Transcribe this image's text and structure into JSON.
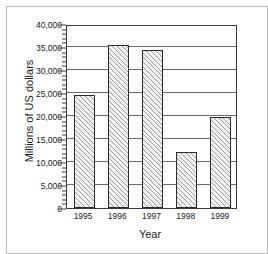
{
  "chart_data": {
    "type": "bar",
    "title": "",
    "xlabel": "Year",
    "ylabel": "Millions of US dollars",
    "categories": [
      "1995",
      "1996",
      "1997",
      "1998",
      "1999"
    ],
    "values": [
      24500,
      35400,
      34300,
      12200,
      19800
    ],
    "series": [
      {
        "name": "Millions of US dollars",
        "values": [
          24500,
          35400,
          34300,
          12200,
          19800
        ]
      }
    ],
    "ylim": [
      0,
      40000
    ],
    "ytick_labels": [
      "0",
      "5,000",
      "10,000",
      "15,000",
      "20,000",
      "25,000",
      "30,000",
      "35,000",
      "40,000"
    ],
    "ytick_values": [
      0,
      5000,
      10000,
      15000,
      20000,
      25000,
      30000,
      35000,
      40000
    ],
    "minor_tick_step": 1000,
    "grid": true,
    "grid_axis": "y",
    "legend": false,
    "bar_fill": "diagonal-hatch",
    "bar_fill_color": "#f2f2f2",
    "bar_edge_color": "#2b2b2b",
    "axis_color": "#3a3a3a",
    "grid_color": "#6b6b6b",
    "background_color": "#ffffff",
    "frame_color": "#b9b9b9"
  }
}
